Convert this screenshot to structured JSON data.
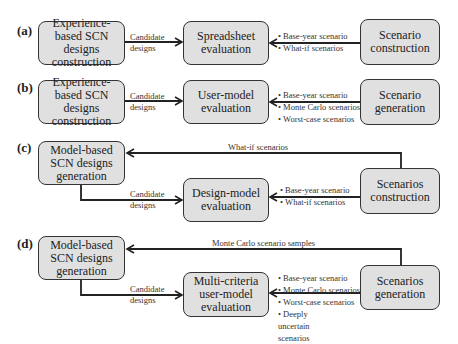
{
  "panels": [
    {
      "label": "(a)",
      "left_box": "Experience-based SCN designs construction",
      "arrow1_label": [
        "Candidate",
        "designs"
      ],
      "middle_box": "Spreadsheet evaluation",
      "arrow2_items": [
        "Base-year scenario",
        "What-if scenarios"
      ],
      "right_box": "Scenario construction"
    },
    {
      "label": "(b)",
      "left_box": "Experience-based SCN designs construction",
      "arrow1_label": [
        "Candidate",
        "designs"
      ],
      "middle_box": "User-model evaluation",
      "arrow2_items": [
        "Base-year scenario",
        "Monte Carlo scenarios",
        "Worst-case scenarios"
      ],
      "right_box": "Scenario generation"
    },
    {
      "label": "(c)",
      "left_box": "Model-based SCN designs generation",
      "feedback_label": "What-if scenarios",
      "arrow1_label": [
        "Candidate",
        "designs"
      ],
      "middle_box": "Design-model evaluation",
      "arrow2_items": [
        "Base-year scenario",
        "What-if scenarios"
      ],
      "right_box": "Scenarios construction"
    },
    {
      "label": "(d)",
      "left_box": "Model-based SCN designs generation",
      "feedback_label": "Monte Carlo scenario samples",
      "arrow1_label": [
        "Candidate",
        "designs"
      ],
      "middle_box": "Multi-criteria user-model evaluation",
      "arrow2_items": [
        "Base-year scenario",
        "Monte Carlo scenarios",
        "Worst-case scenarios",
        "Deeply uncertain scenarios"
      ],
      "right_box": "Scenarios generation"
    }
  ],
  "colors": {
    "box_fill": "#e0e0e0",
    "stroke": "#333333"
  }
}
